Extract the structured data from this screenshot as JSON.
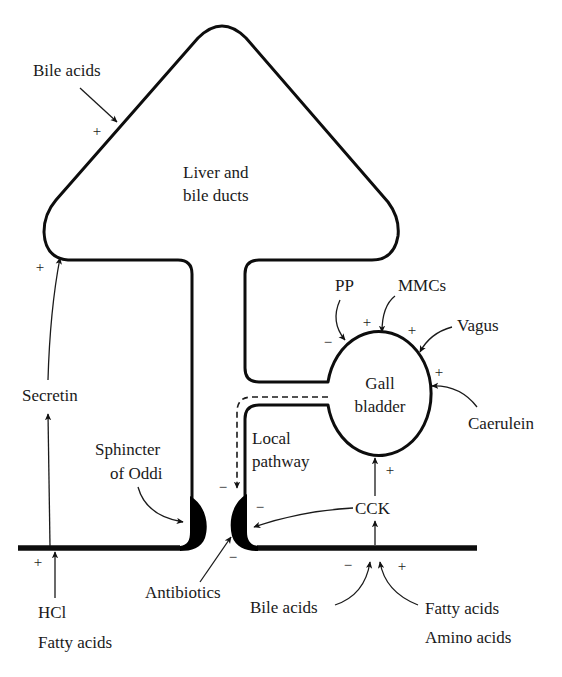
{
  "diagram": {
    "organs": {
      "liver": {
        "line1": "Liver and",
        "line2": "bile ducts"
      },
      "gallbladder": {
        "line1": "Gall",
        "line2": "bladder"
      },
      "sphincter": {
        "line1": "Sphincter",
        "line2": "of Oddi"
      }
    },
    "pathways": {
      "local": {
        "line1": "Local",
        "line2": "pathway"
      }
    },
    "hormones": {
      "secretin": "Secretin",
      "cck": "CCK"
    },
    "stimuli": {
      "bile_acids_liver": "Bile acids",
      "pp": "PP",
      "mmcs": "MMCs",
      "vagus": "Vagus",
      "caerulein": "Caerulein",
      "antibiotics": "Antibiotics",
      "hcl": "HCl",
      "fatty_acids_left": "Fatty acids",
      "bile_acids_duodenum": "Bile acids",
      "fatty_acids_right": "Fatty acids",
      "amino_acids": "Amino acids"
    },
    "signs": {
      "bile_acids_liver": "+",
      "secretin_liver": "+",
      "hcl": "+",
      "pp": "−",
      "mmcs": "+",
      "vagus": "+",
      "caerulein": "+",
      "cck_gallbladder": "+",
      "local_pathway": "−",
      "cck_sphincter": "−",
      "antibiotics": "−",
      "bile_acids_duodenum": "−",
      "fatty_acids_duodenum": "+"
    },
    "colors": {
      "line": "#0d0d0d",
      "text": "#1a1a1a",
      "background": "#ffffff"
    }
  }
}
